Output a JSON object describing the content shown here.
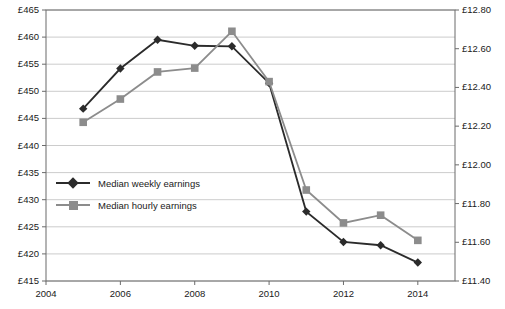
{
  "chart_data": {
    "type": "line",
    "title": "",
    "xlabel": "",
    "ylabel": "",
    "x": [
      2005,
      2006,
      2007,
      2008,
      2009,
      2010,
      2011,
      2012,
      2013,
      2014
    ],
    "xlim": [
      2004,
      2015
    ],
    "x_ticks": [
      "2004",
      "2006",
      "2008",
      "2010",
      "2012",
      "2014"
    ],
    "x_tick_values": [
      2004,
      2006,
      2008,
      2010,
      2012,
      2014
    ],
    "grid": true,
    "legend_position": "inside-left",
    "left_axis": {
      "ticks": [
        "£415",
        "£420",
        "£425",
        "£430",
        "£435",
        "£440",
        "£445",
        "£450",
        "£455",
        "£460",
        "£465"
      ],
      "tick_values": [
        415,
        420,
        425,
        430,
        435,
        440,
        445,
        450,
        455,
        460,
        465
      ],
      "ylim": [
        415,
        465
      ]
    },
    "right_axis": {
      "ticks": [
        "£11.40",
        "£11.60",
        "£11.80",
        "£12.00",
        "£12.20",
        "£12.40",
        "£12.60",
        "£12.80"
      ],
      "tick_values": [
        11.4,
        11.6,
        11.8,
        12.0,
        12.2,
        12.4,
        12.6,
        12.8
      ],
      "ylim": [
        11.4,
        12.8
      ]
    },
    "series": [
      {
        "name": "Median weekly earnings",
        "axis": "left",
        "color": "#2b2b2b",
        "marker": "diamond",
        "values": [
          446.8,
          454.2,
          459.5,
          458.4,
          458.3,
          451.5,
          427.8,
          422.2,
          421.6,
          418.4
        ]
      },
      {
        "name": "Median hourly earnings",
        "axis": "right",
        "color": "#8c8c8c",
        "marker": "square",
        "values": [
          12.22,
          12.34,
          12.48,
          12.5,
          12.69,
          12.43,
          11.87,
          11.7,
          11.74,
          11.61
        ]
      }
    ]
  },
  "legend": [
    {
      "label": "Median weekly earnings",
      "marker": "diamond",
      "color": "#2b2b2b"
    },
    {
      "label": "Median hourly earnings",
      "marker": "square",
      "color": "#8c8c8c"
    }
  ]
}
